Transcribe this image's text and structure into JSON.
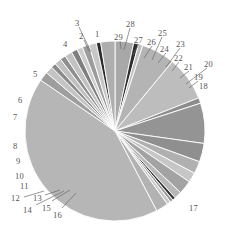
{
  "chart_data": {
    "type": "pie",
    "title": "",
    "subtitle": "",
    "xlabel": "",
    "ylabel": "",
    "grid": false,
    "legend": "none",
    "label_style": "numeric-callout",
    "total": 100,
    "start_angle_deg": -90,
    "direction": "clockwise",
    "center": {
      "x": 115,
      "y": 131
    },
    "radius": 90,
    "categories": [
      "1",
      "2",
      "3",
      "4",
      "5",
      "6",
      "7",
      "8",
      "9",
      "10",
      "11",
      "12",
      "13",
      "14",
      "15",
      "16",
      "17",
      "18",
      "19",
      "20",
      "21",
      "22",
      "23",
      "24",
      "25",
      "26",
      "27",
      "28",
      "29"
    ],
    "values": [
      3.0,
      0.8,
      0.7,
      5.4,
      7.2,
      0.9,
      6.5,
      3.0,
      2.0,
      1.6,
      2.2,
      1.2,
      0.5,
      0.5,
      0.6,
      2.0,
      38.0,
      1.5,
      1.2,
      0.8,
      1.1,
      0.9,
      1.2,
      1.0,
      0.9,
      1.1,
      1.2,
      0.7,
      2.3
    ],
    "slices": [
      {
        "label": "1",
        "value": 3.0,
        "color": "#a8a8a8"
      },
      {
        "label": "2",
        "value": 0.8,
        "color": "#2e2e2e"
      },
      {
        "label": "3",
        "value": 0.7,
        "color": "#bfbfbf"
      },
      {
        "label": "4",
        "value": 5.4,
        "color": "#b4b4b4"
      },
      {
        "label": "5",
        "value": 7.2,
        "color": "#bdbdbd"
      },
      {
        "label": "6",
        "value": 0.9,
        "color": "#8c8c8c"
      },
      {
        "label": "7",
        "value": 6.5,
        "color": "#949494"
      },
      {
        "label": "8",
        "value": 3.0,
        "color": "#8f8f8f"
      },
      {
        "label": "9",
        "value": 2.0,
        "color": "#b0b0b0"
      },
      {
        "label": "10",
        "value": 1.6,
        "color": "#c6c6c6"
      },
      {
        "label": "11",
        "value": 2.2,
        "color": "#a3a3a3"
      },
      {
        "label": "12",
        "value": 1.2,
        "color": "#b8b8b8"
      },
      {
        "label": "13",
        "value": 0.5,
        "color": "#333333"
      },
      {
        "label": "14",
        "value": 0.5,
        "color": "#9a9a9a"
      },
      {
        "label": "15",
        "value": 0.6,
        "color": "#c9c9c9"
      },
      {
        "label": "16",
        "value": 2.0,
        "color": "#b2b2b2"
      },
      {
        "label": "17",
        "value": 38.0,
        "color": "#b6b6b6"
      },
      {
        "label": "18",
        "value": 1.5,
        "color": "#9e9e9e"
      },
      {
        "label": "19",
        "value": 1.2,
        "color": "#c4c4c4"
      },
      {
        "label": "20",
        "value": 0.8,
        "color": "#8a8a8a"
      },
      {
        "label": "21",
        "value": 1.1,
        "color": "#c0c0c0"
      },
      {
        "label": "22",
        "value": 0.9,
        "color": "#8e8e8e"
      },
      {
        "label": "23",
        "value": 1.2,
        "color": "#c2c2c2"
      },
      {
        "label": "24",
        "value": 1.0,
        "color": "#7f7f7f"
      },
      {
        "label": "25",
        "value": 0.9,
        "color": "#cdcdcd"
      },
      {
        "label": "26",
        "value": 1.1,
        "color": "#9c9c9c"
      },
      {
        "label": "27",
        "value": 1.2,
        "color": "#c7c7c7"
      },
      {
        "label": "28",
        "value": 0.7,
        "color": "#2b2b2b"
      },
      {
        "label": "29",
        "value": 2.3,
        "color": "#aeaeae"
      }
    ],
    "separator_color": "#ffffff",
    "background": "#ffffff",
    "label_color": "#555555"
  },
  "labels": [
    {
      "id": "1",
      "text": "1",
      "x": 95,
      "y": 30
    },
    {
      "id": "2",
      "text": "2",
      "x": 79,
      "y": 32
    },
    {
      "id": "3",
      "text": "3",
      "x": 75,
      "y": 19
    },
    {
      "id": "4",
      "text": "4",
      "x": 63,
      "y": 40
    },
    {
      "id": "5",
      "text": "5",
      "x": 33,
      "y": 70
    },
    {
      "id": "6",
      "text": "6",
      "x": 18,
      "y": 96
    },
    {
      "id": "7",
      "text": "7",
      "x": 13,
      "y": 113
    },
    {
      "id": "8",
      "text": "8",
      "x": 13,
      "y": 142
    },
    {
      "id": "9",
      "text": "9",
      "x": 16,
      "y": 157
    },
    {
      "id": "10",
      "text": "10",
      "x": 15,
      "y": 172
    },
    {
      "id": "11",
      "text": "11",
      "x": 20,
      "y": 182
    },
    {
      "id": "12",
      "text": "12",
      "x": 11,
      "y": 194
    },
    {
      "id": "13",
      "text": "13",
      "x": 33,
      "y": 194
    },
    {
      "id": "14",
      "text": "14",
      "x": 23,
      "y": 206
    },
    {
      "id": "15",
      "text": "15",
      "x": 42,
      "y": 204
    },
    {
      "id": "16",
      "text": "16",
      "x": 53,
      "y": 211
    },
    {
      "id": "17",
      "text": "17",
      "x": 189,
      "y": 204
    },
    {
      "id": "18",
      "text": "18",
      "x": 199,
      "y": 82
    },
    {
      "id": "19",
      "text": "19",
      "x": 194,
      "y": 73
    },
    {
      "id": "20",
      "text": "20",
      "x": 204,
      "y": 60
    },
    {
      "id": "21",
      "text": "21",
      "x": 184,
      "y": 63
    },
    {
      "id": "22",
      "text": "22",
      "x": 174,
      "y": 54
    },
    {
      "id": "23",
      "text": "23",
      "x": 176,
      "y": 40
    },
    {
      "id": "24",
      "text": "24",
      "x": 160,
      "y": 45
    },
    {
      "id": "25",
      "text": "25",
      "x": 158,
      "y": 29
    },
    {
      "id": "26",
      "text": "26",
      "x": 147,
      "y": 38
    },
    {
      "id": "27",
      "text": "27",
      "x": 134,
      "y": 36
    },
    {
      "id": "28",
      "text": "28",
      "x": 126,
      "y": 20
    },
    {
      "id": "29",
      "text": "29",
      "x": 114,
      "y": 33
    }
  ],
  "leader_lines": [
    {
      "id": "3",
      "x1": 79,
      "y1": 27,
      "x2": 91,
      "y2": 52
    },
    {
      "id": "2",
      "x1": 84,
      "y1": 40,
      "x2": 89,
      "y2": 51
    },
    {
      "id": "28",
      "x1": 130,
      "y1": 28,
      "x2": 124,
      "y2": 50
    },
    {
      "id": "29",
      "x1": 120,
      "y1": 41,
      "x2": 121,
      "y2": 49
    },
    {
      "id": "27",
      "x1": 139,
      "y1": 44,
      "x2": 133,
      "y2": 55
    },
    {
      "id": "26",
      "x1": 152,
      "y1": 46,
      "x2": 144,
      "y2": 58
    },
    {
      "id": "25",
      "x1": 162,
      "y1": 37,
      "x2": 152,
      "y2": 60
    },
    {
      "id": "24",
      "x1": 166,
      "y1": 53,
      "x2": 158,
      "y2": 63
    },
    {
      "id": "23",
      "x1": 180,
      "y1": 48,
      "x2": 166,
      "y2": 67
    },
    {
      "id": "22",
      "x1": 179,
      "y1": 62,
      "x2": 172,
      "y2": 71
    },
    {
      "id": "21",
      "x1": 189,
      "y1": 71,
      "x2": 180,
      "y2": 78
    },
    {
      "id": "20",
      "x1": 207,
      "y1": 68,
      "x2": 186,
      "y2": 84
    },
    {
      "id": "19",
      "x1": 198,
      "y1": 81,
      "x2": 189,
      "y2": 88
    },
    {
      "id": "12",
      "x1": 24,
      "y1": 197,
      "x2": 44,
      "y2": 191
    },
    {
      "id": "13",
      "x1": 45,
      "y1": 195,
      "x2": 60,
      "y2": 190
    },
    {
      "id": "14",
      "x1": 36,
      "y1": 205,
      "x2": 64,
      "y2": 191
    },
    {
      "id": "15",
      "x1": 52,
      "y1": 201,
      "x2": 70,
      "y2": 190
    },
    {
      "id": "16",
      "x1": 62,
      "y1": 208,
      "x2": 76,
      "y2": 193
    }
  ]
}
